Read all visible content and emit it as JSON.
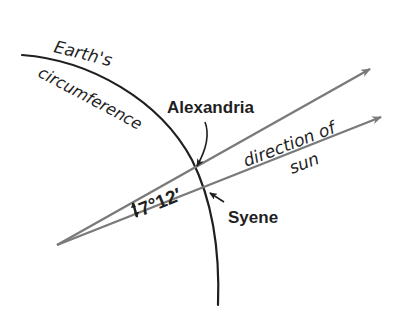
{
  "diagram": {
    "title_labels": {
      "earth": "Earth's",
      "circumference": "circumference",
      "alexandria": "Alexandria",
      "syene": "Syene",
      "direction": "direction of",
      "sun": "sun",
      "angle": "7°12′"
    },
    "colors": {
      "curve": "#1f1f1f",
      "ray": "#7a7a7a",
      "text": "#1f1f1f"
    },
    "elements": [
      {
        "type": "arc",
        "name": "earth-circumference"
      },
      {
        "type": "ray",
        "name": "ray-through-alexandria"
      },
      {
        "type": "ray",
        "name": "ray-through-syene"
      },
      {
        "type": "angle",
        "name": "angle-at-center",
        "value": "7°12′"
      }
    ]
  }
}
